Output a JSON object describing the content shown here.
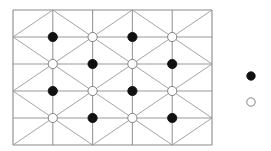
{
  "diagram": {
    "type": "triangular-lattice-with-dots",
    "grid": {
      "x_lines": [
        13,
        52.8,
        92.6,
        132.4,
        172.2,
        212
      ],
      "y_lines": [
        10,
        37,
        64,
        91,
        118,
        145
      ],
      "columns": 5,
      "rows": 5,
      "diagonal_rule": "cell(r,c): '/' if (r+c) even, '\\' if (r+c) odd",
      "line_color": "#9a9a9a",
      "border_color": "#8a8a8a"
    },
    "nodes": [
      {
        "row": 1,
        "col": 1,
        "fill": "black"
      },
      {
        "row": 1,
        "col": 2,
        "fill": "white"
      },
      {
        "row": 1,
        "col": 3,
        "fill": "black"
      },
      {
        "row": 1,
        "col": 4,
        "fill": "white"
      },
      {
        "row": 2,
        "col": 1,
        "fill": "white"
      },
      {
        "row": 2,
        "col": 2,
        "fill": "black"
      },
      {
        "row": 2,
        "col": 3,
        "fill": "white"
      },
      {
        "row": 2,
        "col": 4,
        "fill": "black"
      },
      {
        "row": 3,
        "col": 1,
        "fill": "black"
      },
      {
        "row": 3,
        "col": 2,
        "fill": "white"
      },
      {
        "row": 3,
        "col": 3,
        "fill": "black"
      },
      {
        "row": 3,
        "col": 4,
        "fill": "white"
      },
      {
        "row": 4,
        "col": 1,
        "fill": "white"
      },
      {
        "row": 4,
        "col": 2,
        "fill": "black"
      },
      {
        "row": 4,
        "col": 3,
        "fill": "white"
      },
      {
        "row": 4,
        "col": 4,
        "fill": "black"
      }
    ],
    "legend": [
      {
        "symbol": "filled-circle",
        "fill": "black",
        "x": 251,
        "y": 76
      },
      {
        "symbol": "open-circle",
        "fill": "white",
        "x": 251,
        "y": 102
      }
    ],
    "colors": {
      "black_dot": "#111111",
      "white_dot": "#ffffff",
      "dot_stroke": "#777777"
    }
  }
}
